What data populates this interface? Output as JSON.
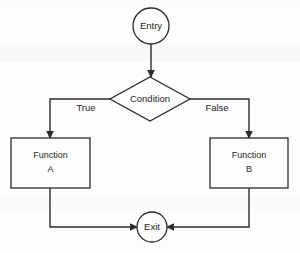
{
  "diagram": {
    "type": "flowchart",
    "background_color": "#fdfdfd",
    "stroke_color": "#2b2b2b",
    "text_color": "#1d1d1d",
    "nodes": [
      {
        "id": "entry",
        "shape": "circle",
        "label": "Entry",
        "cx": 151,
        "cy": 26,
        "r": 18
      },
      {
        "id": "condition",
        "shape": "diamond",
        "label": "Condition",
        "cx": 150,
        "cy": 99,
        "half_width": 40,
        "half_height": 22
      },
      {
        "id": "function_a",
        "shape": "rectangle",
        "label_line1": "Function",
        "label_line2": "A",
        "x": 11,
        "y": 138,
        "width": 79,
        "height": 50
      },
      {
        "id": "function_b",
        "shape": "rectangle",
        "label_line1": "Function",
        "label_line2": "B",
        "x": 210,
        "y": 138,
        "width": 78,
        "height": 50
      },
      {
        "id": "exit",
        "shape": "circle",
        "label": "Exit",
        "cx": 152,
        "cy": 227,
        "r": 15
      }
    ],
    "edges": [
      {
        "id": "entry-to-condition",
        "from": "entry",
        "to": "condition",
        "label": "",
        "path": "M 151 44 L 151 77",
        "arrow_at": {
          "x": 151,
          "y": 77,
          "dir": "down"
        }
      },
      {
        "id": "condition-true-to-function-a",
        "from": "condition",
        "to": "function_a",
        "label": "True",
        "label_x": 86,
        "label_y": 108,
        "path": "M 110 99 L 50 99 L 50 138",
        "arrow_at": {
          "x": 50,
          "y": 138,
          "dir": "down"
        }
      },
      {
        "id": "condition-false-to-function-b",
        "from": "condition",
        "to": "function_b",
        "label": "False",
        "label_x": 217,
        "label_y": 108,
        "path": "M 190 99 L 249 99 L 249 138",
        "arrow_at": {
          "x": 249,
          "y": 138,
          "dir": "down"
        }
      },
      {
        "id": "function-a-to-exit",
        "from": "function_a",
        "to": "exit",
        "label": "",
        "path": "M 50 188 L 50 227 L 137 227",
        "arrow_at": {
          "x": 137,
          "y": 227,
          "dir": "right"
        }
      },
      {
        "id": "function-b-to-exit",
        "from": "function_b",
        "to": "exit",
        "label": "",
        "path": "M 249 188 L 249 227 L 167 227",
        "arrow_at": {
          "x": 167,
          "y": 227,
          "dir": "left"
        }
      }
    ]
  }
}
